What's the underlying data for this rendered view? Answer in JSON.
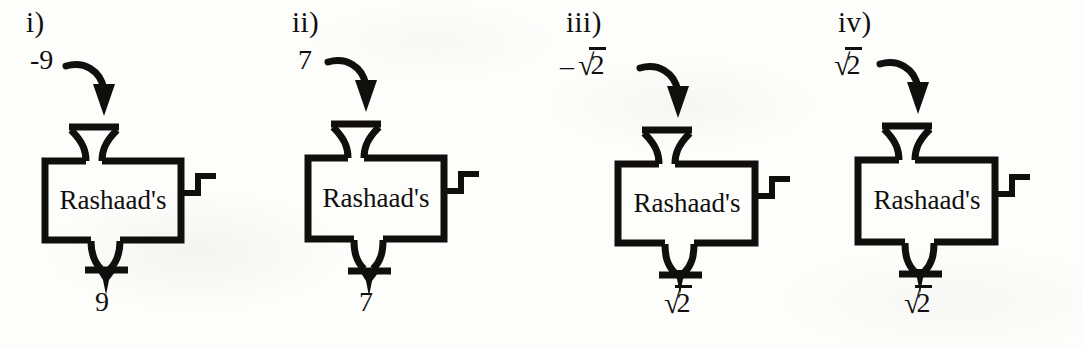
{
  "worksheet": {
    "machine_label": "Rashaad's",
    "ink_color": "#100f0d",
    "paper_color": "#fdfdfc",
    "panel_count": 4
  },
  "panels": [
    {
      "index_label": "i)",
      "input_text": "-9",
      "input_kind": "plain",
      "output_text": "9",
      "output_kind": "plain",
      "machine_name": "Rashaad's"
    },
    {
      "index_label": "ii)",
      "input_text": "7",
      "input_kind": "plain",
      "output_text": "7",
      "output_kind": "plain",
      "machine_name": "Rashaad's"
    },
    {
      "index_label": "iii)",
      "input_text": "–√2",
      "input_kind": "radical",
      "input_minus": "–",
      "input_radicand": "2",
      "output_text": "√2",
      "output_kind": "radical",
      "output_minus": "",
      "output_radicand": "2",
      "machine_name": "Rashaad's"
    },
    {
      "index_label": "iv)",
      "input_text": "√2",
      "input_kind": "radical",
      "input_minus": "",
      "input_radicand": "2",
      "output_text": "√2",
      "output_kind": "radical",
      "output_minus": "",
      "output_radicand": "2",
      "machine_name": "Rashaad's"
    }
  ],
  "icons": {
    "input_arrow": "curved-down-arrow-icon",
    "output_arrow": "down-arrow-icon",
    "hopper": "funnel-icon",
    "chute": "chute-icon",
    "crank": "crank-handle-icon"
  }
}
